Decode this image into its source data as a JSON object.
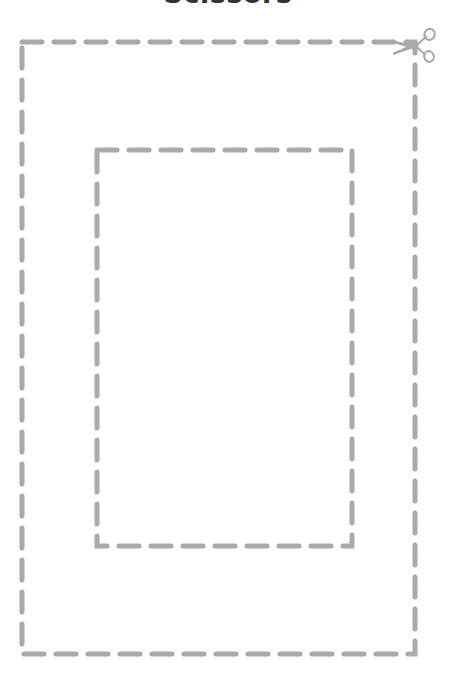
{
  "page": {
    "title": "Scissors",
    "background_color": "#ffffff",
    "width": 456,
    "height": 685
  },
  "worksheet": {
    "kind": "cutting-practice",
    "line_color": "#aaaaaa",
    "title_color": "#333333",
    "stroke_width": 5,
    "dash_length": 20,
    "dash_gap": 12,
    "shapes": [
      {
        "name": "outer-cut-rectangle",
        "type": "rectangle",
        "x": 22,
        "y": 42,
        "width": 393,
        "height": 612,
        "style": "dashed"
      },
      {
        "name": "inner-cut-rectangle",
        "type": "rectangle",
        "x": 97,
        "y": 150,
        "width": 255,
        "height": 396,
        "style": "dashed"
      }
    ],
    "icons": [
      {
        "name": "scissors-icon",
        "label": "scissors",
        "x": 391,
        "y": 26,
        "width": 48,
        "height": 38,
        "color": "#aaaaaa",
        "orientation": "blades-left"
      }
    ]
  }
}
